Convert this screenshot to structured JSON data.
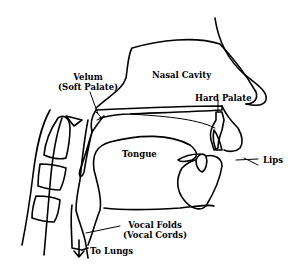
{
  "diagram": {
    "type": "anatomical-line-drawing",
    "labels": {
      "nasal_cavity": "Nasal Cavity",
      "velum_line1": "Velum",
      "velum_line2": "(Soft Palate)",
      "hard_palate": "Hard Palate",
      "tongue": "Tongue",
      "lips": "Lips",
      "vocal_folds_line1": "Vocal Folds",
      "vocal_folds_line2": "(Vocal Cords)",
      "to_lungs": "To Lungs"
    },
    "colors": {
      "line": "#000000",
      "background": "#ffffff"
    }
  }
}
